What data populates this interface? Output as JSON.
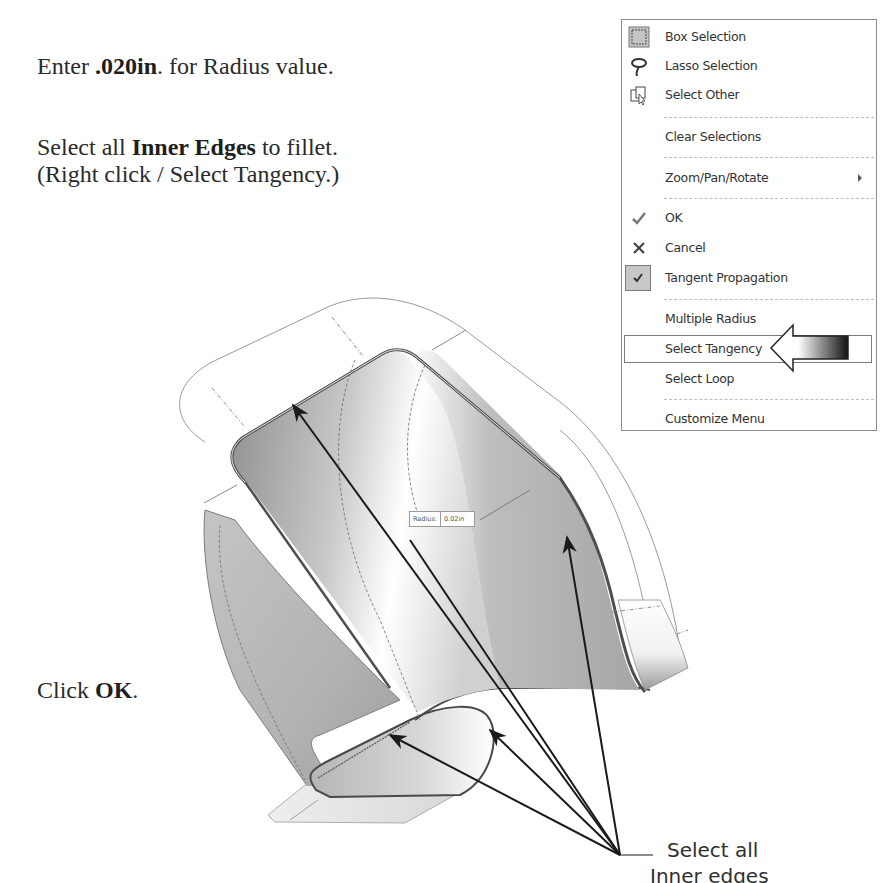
{
  "instructions": {
    "step1": {
      "prefix": "Enter ",
      "bold": ".020in",
      "suffix": ". for Radius value."
    },
    "step2": {
      "prefix": "Select all ",
      "bold": "Inner Edges",
      "suffix": " to fillet."
    },
    "step2_note": "(Right click / Select Tangency.)",
    "step3": {
      "prefix": "Click ",
      "bold": "OK",
      "suffix": "."
    }
  },
  "context_menu": {
    "items": [
      {
        "label": "Box Selection",
        "icon": "box-selection-icon"
      },
      {
        "label": "Lasso Selection",
        "icon": "lasso-icon"
      },
      {
        "label": "Select Other",
        "icon": "select-other-icon"
      },
      {
        "label": "Clear Selections",
        "icon": ""
      },
      {
        "label": "Zoom/Pan/Rotate",
        "icon": "",
        "submenu": true
      },
      {
        "label": "OK",
        "icon": "checkmark-icon"
      },
      {
        "label": "Cancel",
        "icon": "x-icon"
      },
      {
        "label": "Tangent Propagation",
        "icon": "checked-checkbox-icon",
        "checked": true
      },
      {
        "label": "Multiple Radius",
        "icon": ""
      },
      {
        "label": "Select Tangency",
        "icon": "",
        "highlighted": true
      },
      {
        "label": "Select Loop",
        "icon": ""
      },
      {
        "label": "Customize Menu",
        "icon": ""
      }
    ]
  },
  "graphics": {
    "radius_tag": {
      "label": "Radius:",
      "value": "0.02in"
    },
    "callout": {
      "line1": "Select all",
      "line2": "Inner edges"
    }
  },
  "colors": {
    "menu_border": "#8c8c8c",
    "checked_bg": "#c8c8c8",
    "surface_gray": "#a8a8a8",
    "arrow": "#1a1a1a"
  }
}
